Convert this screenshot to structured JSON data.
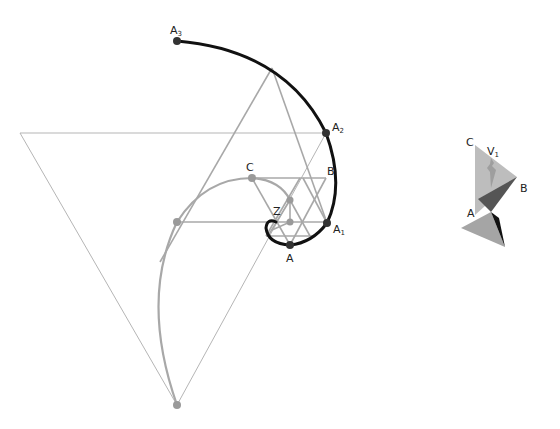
{
  "figure": {
    "main": {
      "labels": {
        "A3": {
          "base": "A",
          "sub": "3"
        },
        "A2": {
          "base": "A",
          "sub": "2"
        },
        "A1": {
          "base": "A",
          "sub": "1"
        },
        "A": "A",
        "B": "B",
        "C": "C",
        "Z": "Z"
      },
      "colors": {
        "spiral": "#111111",
        "construction": "#a8a8a8",
        "thin_lines": "#b0b0b0",
        "gray_points": "#9a9a9a",
        "dark_points": "#333333"
      }
    },
    "inset": {
      "labels": {
        "V1": {
          "base": "V",
          "sub": "1"
        },
        "C": "C",
        "B": "B",
        "A": "A"
      },
      "colors": {
        "light_face": "#bdbdbd",
        "mid_face": "#9e9e9e",
        "dark_face": "#555555",
        "black_face": "#111111"
      }
    }
  }
}
